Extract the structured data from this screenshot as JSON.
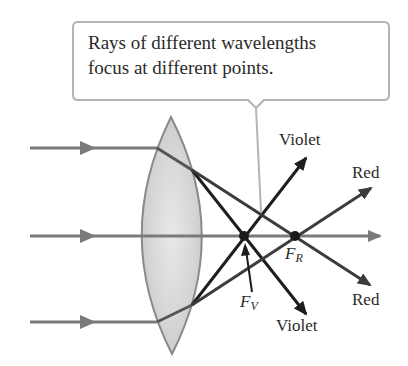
{
  "callout": {
    "line1": "Rays of different wavelengths",
    "line2": "focus at different points."
  },
  "labels": {
    "violet_upper": "Violet",
    "red_upper": "Red",
    "red_lower": "Red",
    "violet_lower": "Violet",
    "focal_red_main": "F",
    "focal_red_sub": "R",
    "focal_violet_main": "F",
    "focal_violet_sub": "V"
  },
  "colors": {
    "incident_ray": "#7a7a7a",
    "violet_ray": "#1e1e1e",
    "red_ray": "#3c3c3c",
    "lens_fill": "#dcdcdc",
    "lens_edge": "#8a8a8a",
    "callout_border": "#b4b4b4"
  }
}
